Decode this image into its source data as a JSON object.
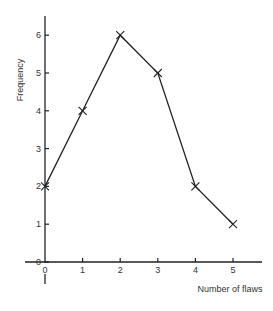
{
  "chart_data": {
    "type": "line",
    "title": "",
    "xlabel": "Number of flaws",
    "ylabel": "Frequency",
    "x": [
      0,
      1,
      2,
      3,
      4,
      5
    ],
    "series": [
      {
        "name": "Frequency",
        "values": [
          2,
          4,
          6,
          5,
          2,
          1
        ],
        "marker": "x"
      }
    ],
    "xticks": [
      "0",
      "1",
      "2",
      "3",
      "4",
      "5"
    ],
    "yticks": [
      "0",
      "1",
      "2",
      "3",
      "4",
      "5",
      "6"
    ],
    "xlim": [
      0,
      5.5
    ],
    "ylim": [
      0,
      6.5
    ],
    "grid": false,
    "legend": "none"
  },
  "labels": {
    "xlabel": "Number of flaws",
    "ylabel": "Frequency"
  }
}
